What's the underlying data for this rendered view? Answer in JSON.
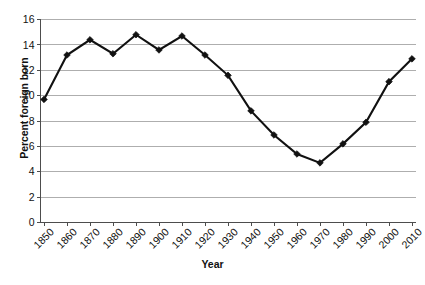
{
  "chart_data": {
    "type": "line",
    "title": "",
    "xlabel": "Year",
    "ylabel": "Percent foreign born",
    "categories": [
      "1850",
      "1860",
      "1870",
      "1880",
      "1890",
      "1900",
      "1910",
      "1920",
      "1930",
      "1940",
      "1950",
      "1960",
      "1970",
      "1980",
      "1990",
      "2000",
      "2010"
    ],
    "x": [
      1850,
      1860,
      1870,
      1880,
      1890,
      1900,
      1910,
      1920,
      1930,
      1940,
      1950,
      1960,
      1970,
      1980,
      1990,
      2000,
      2010
    ],
    "values": [
      9.7,
      13.2,
      14.4,
      13.3,
      14.8,
      13.6,
      14.7,
      13.2,
      11.6,
      8.8,
      6.9,
      5.4,
      4.7,
      6.2,
      7.9,
      11.1,
      12.9
    ],
    "series": [
      {
        "name": "Percent foreign born",
        "values": [
          9.7,
          13.2,
          14.4,
          13.3,
          14.8,
          13.6,
          14.7,
          13.2,
          11.6,
          8.8,
          6.9,
          5.4,
          4.7,
          6.2,
          7.9,
          11.1,
          12.9
        ],
        "color": "#111111",
        "marker": "diamond"
      }
    ],
    "ylim": [
      0,
      16
    ],
    "ytick_values": [
      0,
      2,
      4,
      6,
      8,
      10,
      12,
      14,
      16
    ],
    "ytick_labels": [
      "0",
      "2",
      "4",
      "6",
      "8",
      "10",
      "12",
      "14",
      "16"
    ],
    "xtick_labels": [
      "1850",
      "1860",
      "1870",
      "1880",
      "1890",
      "1900",
      "1910",
      "1920",
      "1930",
      "1940",
      "1950",
      "1960",
      "1970",
      "1980",
      "1990",
      "2000",
      "2010"
    ],
    "xtick_label_rotation": -45,
    "grid": "horizontal",
    "legend": "none",
    "gridline_color": "#9a9a9a",
    "axis_color": "#4d4d4d",
    "background_color": "#ffffff"
  },
  "footnote": {
    "text": ""
  }
}
